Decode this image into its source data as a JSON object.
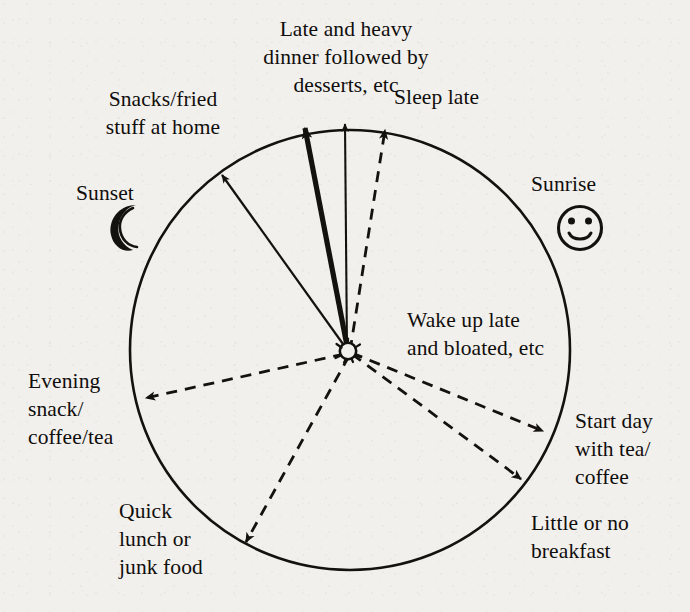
{
  "diagram": {
    "type": "radial-cycle",
    "stroke_color": "#14120f",
    "background_color": "#f2f0ec",
    "center": {
      "x": 348,
      "y": 351,
      "icon": "sun-hub-icon"
    },
    "circle": {
      "cx": 350,
      "cy": 350,
      "r": 220
    },
    "markers": [
      {
        "name": "sunset",
        "label": "Sunset",
        "icon": "crescent-moon-icon",
        "side": "left"
      },
      {
        "name": "sunrise",
        "label": "Sunrise",
        "icon": "smiley-face-icon",
        "side": "right"
      }
    ],
    "spokes": [
      {
        "id": "snacks-fried",
        "label": "Snacks/fried\nstuff at home",
        "style": "solid",
        "weight": "thin",
        "tip": {
          "x": 218,
          "y": 170
        }
      },
      {
        "id": "late-heavy-dinner",
        "label": "Late and heavy\ndinner followed by\ndesserts, etc",
        "style": "solid",
        "weight": "thick",
        "tip": {
          "x": 302,
          "y": 118
        }
      },
      {
        "id": "unlabeled-midnight",
        "label": "",
        "style": "solid",
        "weight": "thin",
        "tip": {
          "x": 344,
          "y": 113
        }
      },
      {
        "id": "sleep-late",
        "label": "Sleep late",
        "style": "dashed",
        "weight": "thin",
        "tip": {
          "x": 386,
          "y": 119
        }
      },
      {
        "id": "wake-up-late",
        "label": "Wake up late\nand bloated, etc",
        "style": "none",
        "weight": "none",
        "tip": {
          "x": 0,
          "y": 0
        }
      },
      {
        "id": "start-day-tea-coffee",
        "label": "Start day\nwith tea/\ncoffee",
        "style": "dashed",
        "weight": "thin",
        "tip": {
          "x": 551,
          "y": 437
        }
      },
      {
        "id": "little-no-breakfast",
        "label": "Little or no\nbreakfast",
        "style": "dashed",
        "weight": "thin",
        "tip": {
          "x": 529,
          "y": 487
        }
      },
      {
        "id": "quick-lunch-junk-food",
        "label": "Quick\nlunch or\njunk food",
        "style": "dashed",
        "weight": "thin",
        "tip": {
          "x": 239,
          "y": 550
        }
      },
      {
        "id": "evening-snack",
        "label": "Evening\nsnack/\ncoffee/tea",
        "style": "dashed",
        "weight": "thin",
        "tip": {
          "x": 136,
          "y": 400
        }
      }
    ]
  },
  "labels": {
    "late_heavy_dinner": "Late and heavy\ndinner followed by\ndesserts, etc",
    "sleep_late": "Sleep late",
    "snacks_fried": "Snacks/fried\nstuff at home",
    "sunset": "Sunset",
    "sunrise": "Sunrise",
    "wake_up_late": "Wake up late\nand bloated, etc",
    "evening_snack": "Evening\nsnack/\ncoffee/tea",
    "start_day": "Start day\nwith tea/\ncoffee",
    "quick_lunch": "Quick\nlunch or\njunk food",
    "little_breakfast": "Little or no\nbreakfast"
  }
}
